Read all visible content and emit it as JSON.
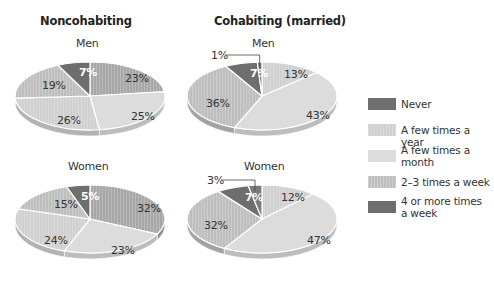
{
  "columns": [
    {
      "title": "Noncohabiting",
      "x": 40
    },
    {
      "title": "Cohabiting (married)",
      "x": 214
    }
  ],
  "colors": {
    "dark": "#6e6e6e",
    "medium_dark": "#a7a7a7",
    "light_solid": "#dcdcdc",
    "light_striped": "#d0d0d0",
    "medium_striped": "#bebebe"
  },
  "legend": [
    {
      "label": "Never",
      "color": "#6e6e6e",
      "striped": false
    },
    {
      "label": "A few times a year",
      "color": "#d0d0d0",
      "striped": true
    },
    {
      "label": "A few times a month",
      "color": "#dcdcdc",
      "striped": false
    },
    {
      "label": "2–3 times a week",
      "color": "#bebebe",
      "striped": true
    },
    {
      "label": "4 or more times a week",
      "color": "#6e6e6e",
      "striped": false
    }
  ],
  "chart_data": [
    {
      "type": "pie",
      "title": "Noncohabiting — Men",
      "group": "Noncohabiting",
      "subgroup": "Men",
      "center": [
        90,
        96
      ],
      "rx": 75,
      "ry": 34,
      "slices": [
        {
          "value": 23,
          "label": "23%",
          "color": "#a7a7a7",
          "lx": 125,
          "ly": 82
        },
        {
          "value": 25,
          "label": "25%",
          "color": "#dcdcdc",
          "lx": 131,
          "ly": 120
        },
        {
          "value": 26,
          "label": "26%",
          "color": "#d0d0d0",
          "lx": 57,
          "ly": 124
        },
        {
          "value": 19,
          "label": "19%",
          "color": "#bebebe",
          "lx": 42,
          "ly": 89
        },
        {
          "value": 7,
          "label": "7%",
          "color": "#6e6e6e",
          "lx": 79,
          "ly": 76,
          "light": true
        }
      ]
    },
    {
      "type": "pie",
      "title": "Cohabiting (married) — Men",
      "group": "Cohabiting (married)",
      "subgroup": "Men",
      "center": [
        262,
        96
      ],
      "rx": 75,
      "ry": 34,
      "slices": [
        {
          "value": 13,
          "label": "13%",
          "color": "#d0d0d0",
          "lx": 284,
          "ly": 78
        },
        {
          "value": 43,
          "label": "43%",
          "color": "#dcdcdc",
          "lx": 306,
          "ly": 119
        },
        {
          "value": 36,
          "label": "36%",
          "color": "#bebebe",
          "lx": 206,
          "ly": 107
        },
        {
          "value": 7,
          "label": "7%",
          "color": "#6e6e6e",
          "lx": 250,
          "ly": 77,
          "light": true
        },
        {
          "value": 1,
          "label": "1%",
          "color": "#7a7a7a",
          "lx": 211,
          "ly": 59,
          "callout": true
        }
      ]
    },
    {
      "type": "pie",
      "title": "Noncohabiting — Women",
      "group": "Noncohabiting",
      "subgroup": "Women",
      "center": [
        90,
        219
      ],
      "rx": 75,
      "ry": 34,
      "slices": [
        {
          "value": 32,
          "label": "32%",
          "color": "#a7a7a7",
          "lx": 137,
          "ly": 212
        },
        {
          "value": 23,
          "label": "23%",
          "color": "#dcdcdc",
          "lx": 111,
          "ly": 254
        },
        {
          "value": 24,
          "label": "24%",
          "color": "#d0d0d0",
          "lx": 44,
          "ly": 244
        },
        {
          "value": 15,
          "label": "15%",
          "color": "#bebebe",
          "lx": 54,
          "ly": 208
        },
        {
          "value": 5,
          "label": "5%",
          "color": "#6e6e6e",
          "lx": 81,
          "ly": 200,
          "light": true
        }
      ]
    },
    {
      "type": "pie",
      "title": "Cohabiting (married) — Women",
      "group": "Cohabiting (married)",
      "subgroup": "Women",
      "center": [
        262,
        219
      ],
      "rx": 75,
      "ry": 34,
      "slices": [
        {
          "value": 12,
          "label": "12%",
          "color": "#d0d0d0",
          "lx": 281,
          "ly": 201
        },
        {
          "value": 47,
          "label": "47%",
          "color": "#dcdcdc",
          "lx": 307,
          "ly": 244
        },
        {
          "value": 32,
          "label": "32%",
          "color": "#bebebe",
          "lx": 204,
          "ly": 229
        },
        {
          "value": 7,
          "label": "7%",
          "color": "#6e6e6e",
          "lx": 245,
          "ly": 201,
          "light": true
        },
        {
          "value": 3,
          "label": "3%",
          "color": "#7a7a7a",
          "lx": 207,
          "ly": 184,
          "callout": true
        }
      ]
    }
  ],
  "pie_titles": [
    {
      "text": "Men",
      "x": 76,
      "y": 37
    },
    {
      "text": "Men",
      "x": 252,
      "y": 37
    },
    {
      "text": "Women",
      "x": 68,
      "y": 160
    },
    {
      "text": "Women",
      "x": 244,
      "y": 160
    }
  ]
}
